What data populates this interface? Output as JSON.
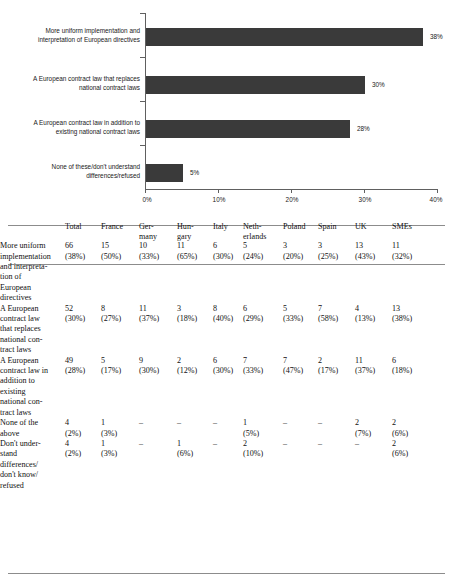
{
  "chart_data": {
    "type": "bar",
    "orientation": "horizontal",
    "title": "",
    "xlabel": "",
    "ylabel": "",
    "xlim": [
      0,
      40
    ],
    "grid": false,
    "legend": false,
    "categories": [
      "More uniform implementation and interpretation of European directives",
      "A European contract law that replaces national contract laws",
      "A European contract law in addition to existing national contract laws",
      "None of these/don't understand differences/refused"
    ],
    "category_lines": [
      [
        "More uniform implementation and",
        "interpretation of European directives"
      ],
      [
        "A European contract law that replaces",
        "national contract laws"
      ],
      [
        "A European contract law in addition to",
        "existing national contract laws"
      ],
      [
        "None of these/don't understand",
        "differences/refused"
      ]
    ],
    "values": [
      38,
      30,
      28,
      5
    ],
    "value_labels": [
      "38%",
      "30%",
      "28%",
      "5%"
    ],
    "xticks": [
      0,
      10,
      20,
      30,
      40
    ],
    "xtick_labels": [
      "0%",
      "10%",
      "20%",
      "30%",
      "40%"
    ],
    "bar_color": "#3a3a3a"
  },
  "table": {
    "columns": [
      "",
      "Total",
      "France",
      "Germany",
      "Hungary",
      "Italy",
      "Netherlands",
      "Poland",
      "Spain",
      "UK",
      "SMEs"
    ],
    "column_display": [
      "",
      [
        "Total"
      ],
      [
        "France"
      ],
      [
        "Ger-",
        "many"
      ],
      [
        "Hun-",
        "gary"
      ],
      [
        "Italy"
      ],
      [
        "Neth-",
        "erlands"
      ],
      [
        "Poland"
      ],
      [
        "Spain"
      ],
      [
        "UK"
      ],
      [
        "SMEs"
      ]
    ],
    "rows": [
      {
        "label": "More uniform implementation and interpretation of European directives",
        "cells": [
          {
            "n": "66",
            "p": "(38%)"
          },
          {
            "n": "15",
            "p": "(50%)"
          },
          {
            "n": "10",
            "p": "(33%)"
          },
          {
            "n": "11",
            "p": "(65%)"
          },
          {
            "n": "6",
            "p": "(30%)"
          },
          {
            "n": "5",
            "p": "(24%)"
          },
          {
            "n": "3",
            "p": "(20%)"
          },
          {
            "n": "3",
            "p": "(25%)"
          },
          {
            "n": "13",
            "p": "(43%)"
          },
          {
            "n": "11",
            "p": "(32%)"
          }
        ]
      },
      {
        "label": "A European contract law that replaces national contract laws",
        "cells": [
          {
            "n": "52",
            "p": "(30%)"
          },
          {
            "n": "8",
            "p": "(27%)"
          },
          {
            "n": "11",
            "p": "(37%)"
          },
          {
            "n": "3",
            "p": "(18%)"
          },
          {
            "n": "8",
            "p": "(40%)"
          },
          {
            "n": "6",
            "p": "(29%)"
          },
          {
            "n": "5",
            "p": "(33%)"
          },
          {
            "n": "7",
            "p": "(58%)"
          },
          {
            "n": "4",
            "p": "(13%)"
          },
          {
            "n": "13",
            "p": "(38%)"
          }
        ]
      },
      {
        "label": "A European contract law in addition to existing national contract laws",
        "cells": [
          {
            "n": "49",
            "p": "(28%)"
          },
          {
            "n": "5",
            "p": "(17%)"
          },
          {
            "n": "9",
            "p": "(30%)"
          },
          {
            "n": "2",
            "p": "(12%)"
          },
          {
            "n": "6",
            "p": "(30%)"
          },
          {
            "n": "7",
            "p": "(33%)"
          },
          {
            "n": "7",
            "p": "(47%)"
          },
          {
            "n": "2",
            "p": "(17%)"
          },
          {
            "n": "11",
            "p": "(37%)"
          },
          {
            "n": "6",
            "p": "(18%)"
          }
        ]
      },
      {
        "label": "None of the above",
        "cells": [
          {
            "n": "4",
            "p": "(2%)"
          },
          {
            "n": "1",
            "p": "(3%)"
          },
          {
            "n": "–",
            "p": ""
          },
          {
            "n": "–",
            "p": ""
          },
          {
            "n": "–",
            "p": ""
          },
          {
            "n": "1",
            "p": "(5%)"
          },
          {
            "n": "–",
            "p": ""
          },
          {
            "n": "–",
            "p": ""
          },
          {
            "n": "2",
            "p": "(7%)"
          },
          {
            "n": "2",
            "p": "(6%)"
          }
        ]
      },
      {
        "label": "Don't understand differences/ don't know/ refused",
        "cells": [
          {
            "n": "4",
            "p": "(2%)"
          },
          {
            "n": "1",
            "p": "(3%)"
          },
          {
            "n": "–",
            "p": ""
          },
          {
            "n": "1",
            "p": "(6%)"
          },
          {
            "n": "–",
            "p": ""
          },
          {
            "n": "2",
            "p": "(10%)"
          },
          {
            "n": "–",
            "p": ""
          },
          {
            "n": "–",
            "p": ""
          },
          {
            "n": "–",
            "p": ""
          },
          {
            "n": "2",
            "p": "(6%)"
          }
        ]
      }
    ],
    "row_label_lines": [
      [
        "More uniform",
        "implementation",
        "and interpreta-",
        "tion of",
        "European",
        "directives"
      ],
      [
        "A European",
        "contract law",
        "that replaces",
        "national con-",
        "tract laws"
      ],
      [
        "A European",
        "contract law in",
        "addition to",
        "existing",
        "national con-",
        "tract laws"
      ],
      [
        "None of the",
        "above"
      ],
      [
        "Don't under-",
        "stand",
        "differences/",
        "don't know/",
        "refused"
      ]
    ]
  }
}
